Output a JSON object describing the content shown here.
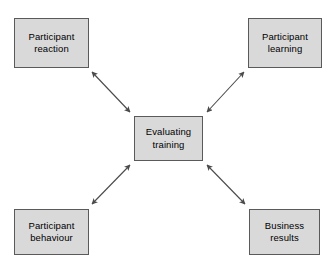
{
  "diagram": {
    "type": "hub-and-spoke",
    "canvas": {
      "width": 336,
      "height": 268,
      "background": "#ffffff"
    },
    "style": {
      "node_fill": "#d9d9d9",
      "node_border": "#5a5a5a",
      "text_color": "#000000",
      "arrow_color": "#4a4a4a"
    },
    "center": {
      "id": "evaluating-training",
      "label": "Evaluating\ntraining"
    },
    "nodes": [
      {
        "id": "participant-reaction",
        "label": "Participant\nreaction",
        "position": "top-left"
      },
      {
        "id": "participant-learning",
        "label": "Participant\nlearning",
        "position": "top-right"
      },
      {
        "id": "participant-behaviour",
        "label": "Participant\nbehaviour",
        "position": "bottom-left"
      },
      {
        "id": "business-results",
        "label": "Business\nresults",
        "position": "bottom-right"
      }
    ],
    "connectors": [
      {
        "id": "reaction-center",
        "from": "participant-reaction",
        "to": "evaluating-training",
        "arrowheads": "both",
        "style": "solid"
      },
      {
        "id": "learning-center",
        "from": "participant-learning",
        "to": "evaluating-training",
        "arrowheads": "both",
        "style": "solid"
      },
      {
        "id": "behaviour-center",
        "from": "participant-behaviour",
        "to": "evaluating-training",
        "arrowheads": "both",
        "style": "solid"
      },
      {
        "id": "results-center",
        "from": "business-results",
        "to": "evaluating-training",
        "arrowheads": "both",
        "style": "solid"
      }
    ]
  }
}
